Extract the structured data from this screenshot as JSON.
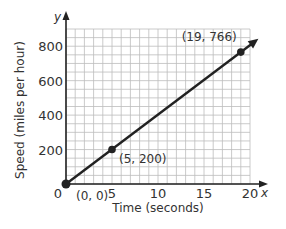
{
  "chart_data": {
    "type": "line",
    "title": "",
    "xlabel": "Time (seconds)",
    "ylabel": "Speed (miles per hour)",
    "x_axis_var": "x",
    "y_axis_var": "y",
    "xlim": [
      0,
      20
    ],
    "ylim": [
      0,
      900
    ],
    "x_ticks": [
      0,
      5,
      10,
      15,
      20
    ],
    "x_tick_labels": [
      "0",
      "5",
      "10",
      "15",
      "20"
    ],
    "y_ticks": [
      200,
      400,
      600,
      800
    ],
    "y_tick_labels": [
      "200",
      "400",
      "600",
      "800"
    ],
    "grid": true,
    "grid_x_step": 1,
    "grid_y_step": 50,
    "series": [
      {
        "name": "speed",
        "x": [
          0,
          5,
          19
        ],
        "y": [
          0,
          200,
          766
        ],
        "arrow_end": true
      }
    ],
    "points": [
      {
        "x": 0,
        "y": 0,
        "label": "(0, 0)"
      },
      {
        "x": 5,
        "y": 200,
        "label": "(5, 200)"
      },
      {
        "x": 19,
        "y": 766,
        "label": "(19, 766)"
      }
    ],
    "colors": {
      "line": "#222222",
      "grid": "#bdbdbd",
      "axis": "#222222",
      "text": "#333333"
    }
  }
}
